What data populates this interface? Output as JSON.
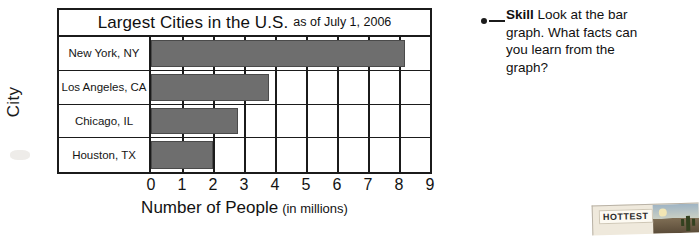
{
  "chart_data": {
    "type": "bar",
    "title": "Largest Cities in the U.S.",
    "title_suffix": "as of July 1, 2006",
    "orientation": "horizontal",
    "categories": [
      "New York, NY",
      "Los Angeles, CA",
      "Chicago, IL",
      "Houston, TX"
    ],
    "values": [
      8.2,
      3.8,
      2.8,
      2.0
    ],
    "xlabel": "Number of People",
    "xlabel_suffix": "(in millions)",
    "ylabel": "City",
    "xlim": [
      0,
      9
    ],
    "xticks": [
      "0",
      "1",
      "2",
      "3",
      "4",
      "5",
      "6",
      "7",
      "8",
      "9"
    ],
    "grid": true,
    "legend": "none",
    "bar_color": "#6e6e6e"
  },
  "callout": {
    "label": "Skill",
    "text": "Look at the bar graph. What facts can you learn from the graph?"
  },
  "photo": {
    "label": "HOTTEST"
  }
}
